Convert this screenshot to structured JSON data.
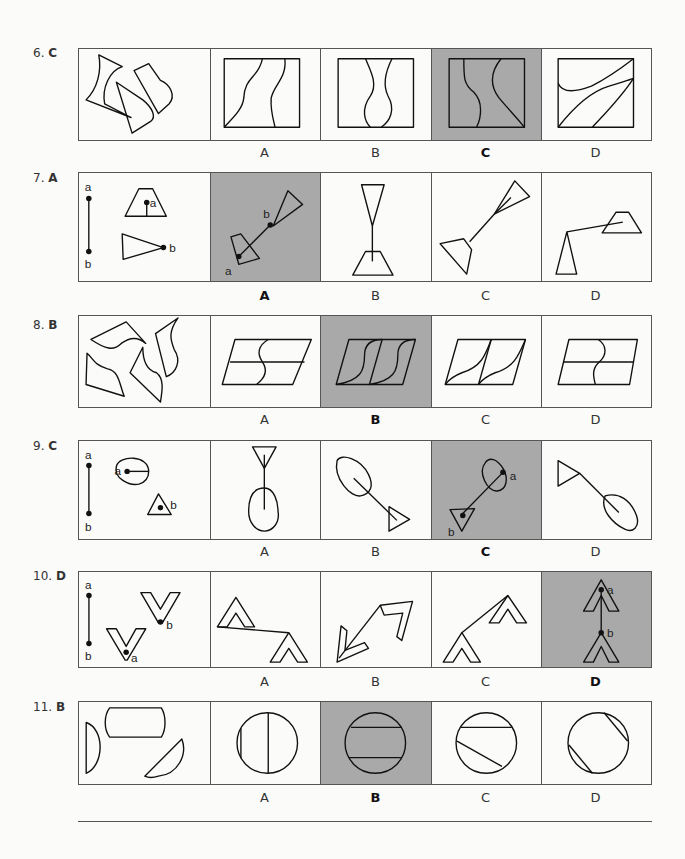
{
  "questions": [
    {
      "number": "6.",
      "answer": "C",
      "options": [
        "A",
        "B",
        "C",
        "D"
      ],
      "selected_index": 2,
      "prompt_labels": []
    },
    {
      "number": "7.",
      "answer": "A",
      "options": [
        "A",
        "B",
        "C",
        "D"
      ],
      "selected_index": 0,
      "prompt_labels": [
        "a",
        "b",
        "a",
        "b"
      ],
      "option_labels": [
        "b",
        "a"
      ]
    },
    {
      "number": "8.",
      "answer": "B",
      "options": [
        "A",
        "B",
        "C",
        "D"
      ],
      "selected_index": 1,
      "prompt_labels": []
    },
    {
      "number": "9.",
      "answer": "C",
      "options": [
        "A",
        "B",
        "C",
        "D"
      ],
      "selected_index": 2,
      "prompt_labels": [
        "a",
        "b",
        "a",
        "b"
      ],
      "option_labels": [
        "a",
        "b"
      ]
    },
    {
      "number": "10.",
      "answer": "D",
      "options": [
        "A",
        "B",
        "C",
        "D"
      ],
      "selected_index": 3,
      "prompt_labels": [
        "a",
        "b",
        "b",
        "a"
      ],
      "option_labels": [
        "a",
        "b"
      ]
    },
    {
      "number": "11.",
      "answer": "B",
      "options": [
        "A",
        "B",
        "C",
        "D"
      ],
      "selected_index": 1,
      "prompt_labels": []
    }
  ],
  "colors": {
    "selected_bg": "#a9a9a9",
    "border": "#555555",
    "ink": "#111111"
  }
}
